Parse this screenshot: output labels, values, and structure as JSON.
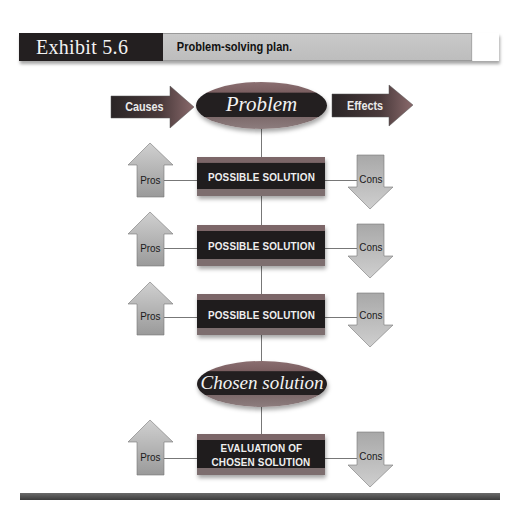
{
  "header": {
    "exhibit_label": "Exhibit 5.6",
    "caption": "Problem-solving plan."
  },
  "diagram": {
    "causes_label": "Causes",
    "problem_label": "Problem",
    "effects_label": "Effects",
    "solution_rows": [
      {
        "pros": "Pros",
        "box": "POSSIBLE SOLUTION",
        "cons": "Cons"
      },
      {
        "pros": "Pros",
        "box": "POSSIBLE SOLUTION",
        "cons": "Cons"
      },
      {
        "pros": "Pros",
        "box": "POSSIBLE SOLUTION",
        "cons": "Cons"
      }
    ],
    "chosen_label": "Chosen solution",
    "evaluation": {
      "pros": "Pros",
      "line1": "EVALUATION OF",
      "line2": "CHOSEN SOLUTION",
      "cons": "Cons"
    }
  },
  "colors": {
    "dark_fill": "#231f20",
    "band_fill": "#7c6668",
    "arrow_gray": "#b0b0b0",
    "header_light": "#c4c4c4"
  }
}
